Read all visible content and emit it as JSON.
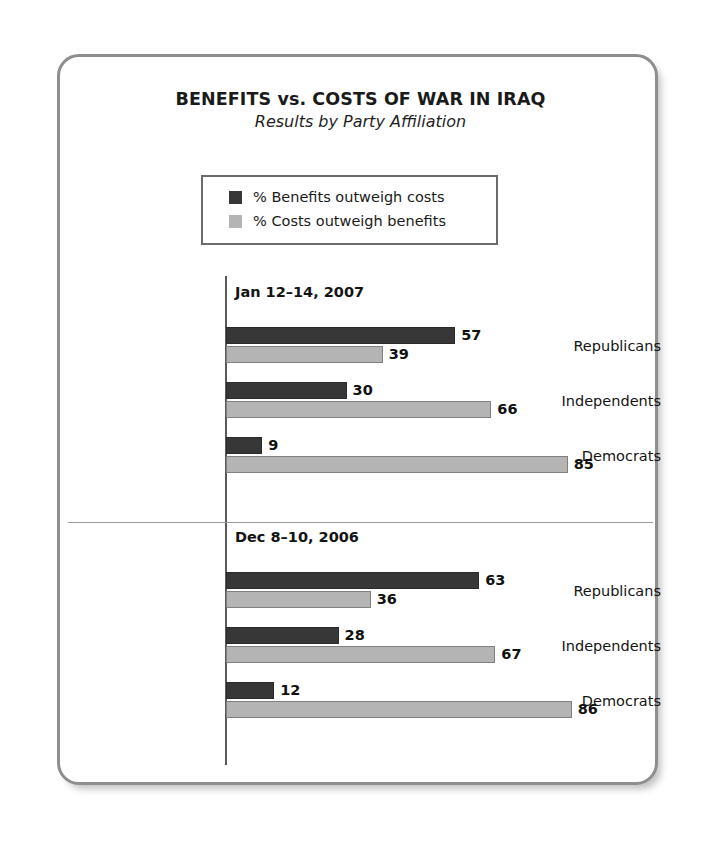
{
  "chart_data": {
    "type": "bar",
    "orientation": "horizontal",
    "title": "BENEFITS vs. COSTS OF WAR IN IRAQ",
    "subtitle": "Results by Party Affiliation",
    "xlabel": "",
    "ylabel": "",
    "xlim": [
      0,
      100
    ],
    "grid": false,
    "legend_position": "top-center",
    "categories": [
      "Republicans",
      "Independents",
      "Democrats"
    ],
    "series": [
      {
        "name": "% Benefits outweigh costs",
        "color": "#373737"
      },
      {
        "name": "% Costs outweigh benefits",
        "color": "#b4b4b4"
      }
    ],
    "panels": [
      {
        "header": "Jan 12–14, 2007",
        "groups": [
          {
            "label": "Republicans",
            "values": [
              57,
              39
            ]
          },
          {
            "label": "Independents",
            "values": [
              30,
              66
            ]
          },
          {
            "label": "Democrats",
            "values": [
              9,
              85
            ]
          }
        ]
      },
      {
        "header": "Dec 8–10, 2006",
        "groups": [
          {
            "label": "Republicans",
            "values": [
              63,
              36
            ]
          },
          {
            "label": "Independents",
            "values": [
              28,
              67
            ]
          },
          {
            "label": "Democrats",
            "values": [
              12,
              86
            ]
          }
        ]
      }
    ]
  },
  "legend": {
    "items": [
      {
        "label": "% Benefits outweigh costs",
        "color": "#373737",
        "swatch": "dark-square-swatch"
      },
      {
        "label": "% Costs outweigh benefits",
        "color": "#b4b4b4",
        "swatch": "light-square-swatch"
      }
    ]
  },
  "panels": [
    {
      "header": "Jan 12–14, 2007",
      "rows": [
        {
          "label": "Republicans",
          "benefits": 57,
          "costs": 39
        },
        {
          "label": "Independents",
          "benefits": 30,
          "costs": 66
        },
        {
          "label": "Democrats",
          "benefits": 9,
          "costs": 85
        }
      ]
    },
    {
      "header": "Dec 8–10, 2006",
      "rows": [
        {
          "label": "Republicans",
          "benefits": 63,
          "costs": 36
        },
        {
          "label": "Independents",
          "benefits": 28,
          "costs": 67
        },
        {
          "label": "Democrats",
          "benefits": 12,
          "costs": 86
        }
      ]
    }
  ],
  "title": {
    "main": "BENEFITS vs. COSTS OF WAR IN IRAQ",
    "sub": "Results by Party Affiliation"
  }
}
